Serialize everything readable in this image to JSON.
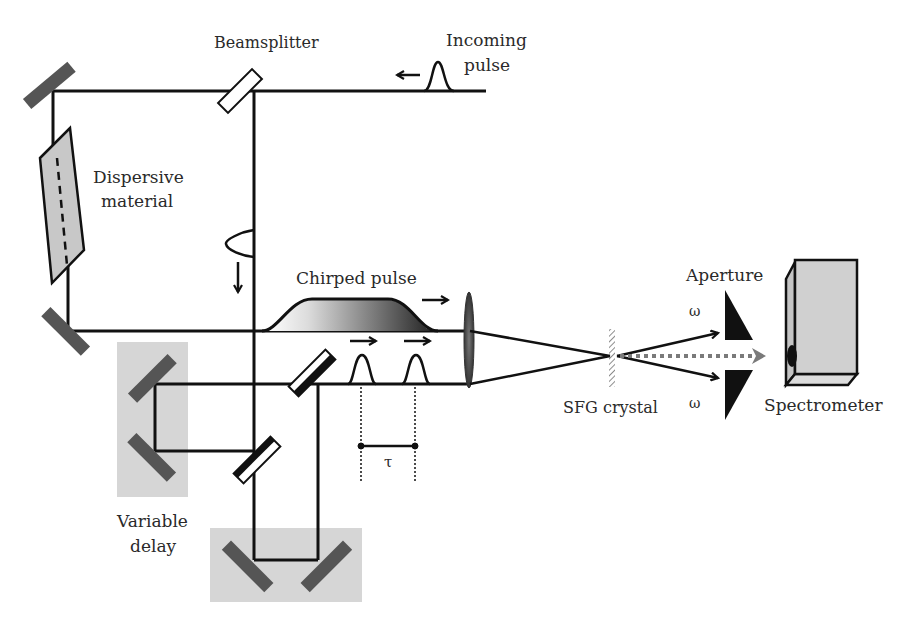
{
  "diagram": {
    "labels": {
      "beamsplitter": "Beamsplitter",
      "incoming_pulse_line1": "Incoming",
      "incoming_pulse_line2": "pulse",
      "dispersive_line1": "Dispersive",
      "dispersive_line2": "material",
      "chirped_pulse": "Chirped pulse",
      "aperture": "Aperture",
      "omega_top": "ω",
      "omega_bottom": "ω",
      "sfg_crystal": "SFG crystal",
      "spectrometer": "Spectrometer",
      "tau": "τ",
      "variable_delay_line1": "Variable",
      "variable_delay_line2": "delay"
    },
    "colors": {
      "beam": "#111111",
      "mirror": "#555555",
      "delay_stage": "#d6d6d6",
      "dispersive_fill": "#c8c8c8",
      "spectrometer_fill": "#d0d0d0",
      "sfg_signal": "#7a7a7a"
    }
  }
}
